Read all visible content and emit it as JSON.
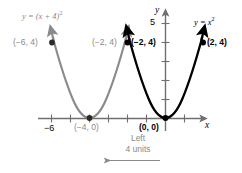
{
  "figure": {
    "title_alt": "Graph of y = x squared and its horizontal shift y = (x + 4) squared",
    "background": "#ffffff",
    "colors": {
      "original_curve": "#000000",
      "shifted_curve": "#8a8a8a",
      "axis": "#6f6f6f",
      "point_black": "#000000",
      "point_gray": "#6f6f6f",
      "note_text": "#8a8a8a"
    }
  },
  "axes": {
    "x_label": "x",
    "y_label": "y",
    "x_tick_labels": [
      {
        "text": "−6",
        "value": -6
      }
    ],
    "y_tick_labels": [
      {
        "text": "5",
        "value": 5
      }
    ],
    "x_range": [
      -7.0,
      2.6
    ],
    "y_range": [
      -1.0,
      5.6
    ],
    "grid": false,
    "tick_spacing": 1
  },
  "curves": [
    {
      "id": "shifted",
      "equation_label": "y = (x + 4)",
      "equation_exponent": "2",
      "color": "#8a8a8a",
      "vertex": [
        -4,
        0
      ],
      "expression": "y = (x + 4)^2",
      "points": [
        {
          "label": "(−6, 4)",
          "x": -6,
          "y": 4,
          "label_side": "left"
        },
        {
          "label": "(−4, 0)",
          "x": -4,
          "y": 0,
          "label_side": "below"
        },
        {
          "label": "(−2, 4)",
          "x": -2,
          "y": 4,
          "label_side": "left"
        }
      ]
    },
    {
      "id": "original",
      "equation_label": "y = x",
      "equation_exponent": "2",
      "color": "#000000",
      "vertex": [
        0,
        0
      ],
      "expression": "y = x^2",
      "points": [
        {
          "label": "(−2, 4)",
          "x": -2,
          "y": 4,
          "label_side": "right"
        },
        {
          "label": "(0, 0)",
          "x": 0,
          "y": 0,
          "label_side": "below-left"
        },
        {
          "label": "(2, 4)",
          "x": 2,
          "y": 4,
          "label_side": "right"
        }
      ]
    }
  ],
  "annotation": {
    "line1": "Left",
    "line2": "4 units",
    "arrow_direction": "left",
    "color": "#8a8a8a"
  }
}
